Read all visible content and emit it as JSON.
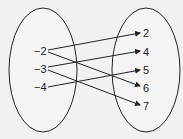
{
  "diagram": {
    "type": "mapping",
    "domain": {
      "values": [
        "−2",
        "−3",
        "−4"
      ]
    },
    "range": {
      "values": [
        "2",
        "4",
        "5",
        "6",
        "7"
      ]
    },
    "mappings": [
      {
        "from": "−2",
        "to": "2"
      },
      {
        "from": "−2",
        "to": "6"
      },
      {
        "from": "−3",
        "to": "4"
      },
      {
        "from": "−3",
        "to": "7"
      },
      {
        "from": "−4",
        "to": "5"
      }
    ]
  }
}
